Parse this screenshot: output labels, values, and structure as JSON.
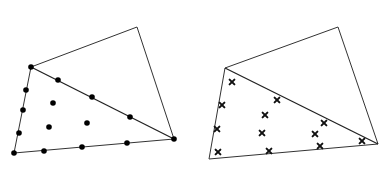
{
  "figure": {
    "width": 392,
    "height": 184,
    "colors": {
      "background": "#ffffff",
      "line": "#333333",
      "marker": "#000000"
    }
  },
  "panels": [
    {
      "name": "left-panel",
      "marker": "dot",
      "vertices": {
        "top": [
          137,
          27
        ],
        "left_top": [
          31,
          67
        ],
        "right": [
          174,
          139
        ],
        "bottom_left": [
          14,
          153
        ]
      },
      "edges": [
        [
          "left_top",
          "top"
        ],
        [
          "top",
          "right"
        ],
        [
          "right",
          "bottom_left"
        ],
        [
          "bottom_left",
          "left_top"
        ],
        [
          "left_top",
          "right"
        ]
      ],
      "diagonal": [
        "left_top",
        "right"
      ],
      "points": [
        [
          31,
          67
        ],
        [
          174,
          139
        ],
        [
          14,
          153
        ],
        [
          58,
          80
        ],
        [
          92,
          97
        ],
        [
          130,
          117
        ],
        [
          26,
          90
        ],
        [
          23,
          110
        ],
        [
          19,
          133
        ],
        [
          44,
          151
        ],
        [
          82,
          147
        ],
        [
          127,
          143
        ],
        [
          53,
          103
        ],
        [
          49,
          127
        ],
        [
          87,
          123
        ]
      ]
    },
    {
      "name": "right-panel",
      "marker": "cross",
      "vertices": {
        "top": [
          338,
          27
        ],
        "left_top": [
          225,
          68
        ],
        "right": [
          378,
          144
        ],
        "bottom_left": [
          209,
          159
        ]
      },
      "edges": [
        [
          "left_top",
          "top"
        ],
        [
          "top",
          "right"
        ],
        [
          "right",
          "bottom_left"
        ],
        [
          "bottom_left",
          "left_top"
        ],
        [
          "left_top",
          "right"
        ]
      ],
      "diagonal": [
        "left_top",
        "right"
      ],
      "points": [
        [
          232,
          82
        ],
        [
          222,
          105
        ],
        [
          217,
          129
        ],
        [
          218,
          152
        ],
        [
          277,
          100
        ],
        [
          265,
          115
        ],
        [
          262,
          133
        ],
        [
          269,
          151
        ],
        [
          324,
          123
        ],
        [
          315,
          134
        ],
        [
          320,
          146
        ],
        [
          362,
          141
        ]
      ]
    }
  ]
}
